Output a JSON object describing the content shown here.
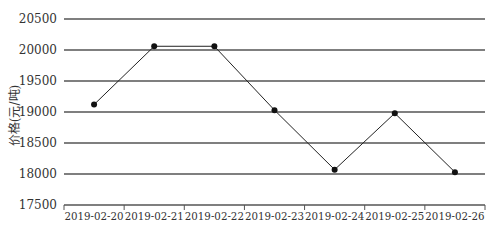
{
  "chart_data": {
    "type": "line",
    "title": "",
    "xlabel": "",
    "ylabel": "价格(元/吨)",
    "categories": [
      "2019-02-20",
      "2019-02-21",
      "2019-02-22",
      "2019-02-23",
      "2019-02-24",
      "2019-02-25",
      "2019-02-26"
    ],
    "series": [
      {
        "name": "价格",
        "values": [
          19120,
          20060,
          20060,
          19030,
          18070,
          18980,
          18030
        ]
      }
    ],
    "ylim": [
      17500,
      20500
    ],
    "yticks": [
      17500,
      18000,
      18500,
      19000,
      19500,
      20000,
      20500
    ],
    "grid": true,
    "legend": "none",
    "colors": {
      "line": "#222222",
      "grid": "#555555",
      "marker": "#111111",
      "text": "#333333"
    }
  }
}
